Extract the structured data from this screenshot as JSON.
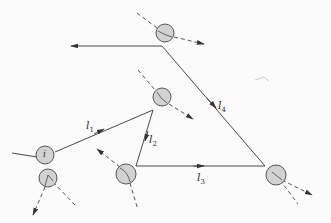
{
  "diagram": {
    "type": "particle interaction / tracking diagram",
    "colors": {
      "line": "#4a4a4a",
      "node_fill": "#d2d2d2",
      "node_stroke": "#555555",
      "background": "#fbfbfb"
    },
    "nodes": [
      {
        "id": "top",
        "cx": 165,
        "cy": 33
      },
      {
        "id": "middle",
        "cx": 162,
        "cy": 97
      },
      {
        "id": "i",
        "cx": 45,
        "cy": 155,
        "label": "i"
      },
      {
        "id": "i-lower",
        "cx": 48,
        "cy": 178
      },
      {
        "id": "bottom-mid",
        "cx": 126,
        "cy": 174
      },
      {
        "id": "right",
        "cx": 276,
        "cy": 175
      }
    ],
    "edges": [
      {
        "label": "l",
        "sub": "1",
        "lx": 86,
        "ly": 120
      },
      {
        "label": "l",
        "sub": "2",
        "lx": 149,
        "ly": 134
      },
      {
        "label": "l",
        "sub": "3",
        "lx": 197,
        "ly": 172
      },
      {
        "label": "l",
        "sub": "4",
        "lx": 218,
        "ly": 100
      }
    ],
    "node_i_label": "i"
  }
}
